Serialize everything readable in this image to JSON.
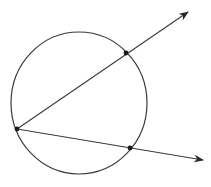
{
  "diagram": {
    "type": "circle-with-secant-rays",
    "stroke_color": "#3a3a3a",
    "point_color": "#1a1a1a",
    "background": "#ffffff",
    "circle": {
      "cx": 79,
      "cy": 103,
      "rx": 68,
      "ry": 71
    },
    "vertex": {
      "x": 17,
      "y": 129
    },
    "rays": [
      {
        "name": "upper-ray",
        "from": [
          17,
          129
        ],
        "to": [
          188,
          12
        ],
        "intersection": [
          126,
          53
        ]
      },
      {
        "name": "lower-ray",
        "from": [
          17,
          129
        ],
        "to": [
          203,
          160
        ],
        "intersection": [
          130,
          148
        ]
      }
    ]
  }
}
